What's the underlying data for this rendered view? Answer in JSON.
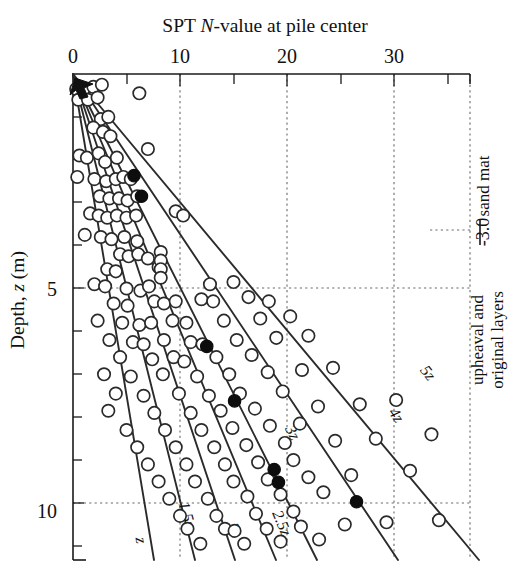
{
  "chart_data": {
    "type": "scatter",
    "title": "SPT N-value at pile center",
    "title_parts": {
      "pre": "SPT ",
      "italic": "N",
      "post": "-value at pile center"
    },
    "xlabel": "SPT N-value at pile center",
    "ylabel": "Depth, z (m)",
    "ylabel_parts": {
      "pre": "Depth, ",
      "italic": "z",
      "post": " (m)"
    },
    "xlim": [
      0,
      35
    ],
    "ylim": [
      0,
      11.35
    ],
    "y_inverted": true,
    "xticks_major": [
      0,
      10,
      20,
      30
    ],
    "xticklabels": [
      "0",
      "10",
      "20",
      "30"
    ],
    "xticks_minor": [
      5,
      15,
      25,
      35
    ],
    "yticks_major": [
      5,
      10
    ],
    "yticklabels": [
      "5",
      "10"
    ],
    "yticks_minor": [
      1,
      2,
      3,
      4,
      6,
      7,
      8,
      9,
      11
    ],
    "grid": "dotted",
    "grid_x": [
      10,
      20,
      30,
      35
    ],
    "grid_y": [
      5,
      10
    ],
    "legend_position": "none",
    "annotations": [
      {
        "name": "sand-mat",
        "text": "sand mat",
        "rotation": -90
      },
      {
        "name": "depth-marker",
        "text": "-3.0",
        "rotation": -90
      },
      {
        "name": "layers-line-1",
        "text": "upheaval and",
        "rotation": -90
      },
      {
        "name": "layers-line-2",
        "text": "original layers",
        "rotation": -90
      },
      {
        "name": "origin-arrow",
        "text": "",
        "rotation": 0
      }
    ],
    "curves": [
      {
        "label": "z",
        "slope_n_per_m": 1.3,
        "label_x": 5.9,
        "label_z": 10.7
      },
      {
        "label": "1.5z",
        "slope_n_per_m": 1.95,
        "label_x": 10.2,
        "label_z": 10.2
      },
      {
        "label": "2z",
        "slope_n_per_m": 2.6,
        "label_x": 14.0,
        "label_z": 10.5
      },
      {
        "label": "2.5z",
        "slope_n_per_m": 3.25,
        "label_x": 18.2,
        "label_z": 10.5
      },
      {
        "label": "3z",
        "slope_n_per_m": 3.9,
        "label_x": 19.5,
        "label_z": 8.3
      },
      {
        "label": "4z",
        "slope_n_per_m": 5.2,
        "label_x": 29.0,
        "label_z": 7.9
      },
      {
        "label": "5z",
        "slope_n_per_m": 6.5,
        "label_x": 31.5,
        "label_z": 7.0
      }
    ],
    "series": [
      {
        "name": "open-circles",
        "marker": "open circle",
        "points": [
          [
            0.3,
            0.35
          ],
          [
            1.0,
            0.35
          ],
          [
            1.9,
            0.3
          ],
          [
            2.7,
            0.25
          ],
          [
            0.5,
            0.6
          ],
          [
            1.4,
            0.6
          ],
          [
            2.3,
            0.55
          ],
          [
            6.2,
            0.45
          ],
          [
            2.6,
            1.05
          ],
          [
            3.3,
            1.0
          ],
          [
            1.9,
            1.25
          ],
          [
            2.8,
            1.35
          ],
          [
            3.5,
            1.45
          ],
          [
            0.6,
            1.9
          ],
          [
            1.3,
            1.95
          ],
          [
            2.4,
            1.85
          ],
          [
            3.0,
            2.05
          ],
          [
            4.1,
            1.95
          ],
          [
            7.0,
            1.75
          ],
          [
            0.4,
            2.4
          ],
          [
            2.0,
            2.45
          ],
          [
            3.1,
            2.5
          ],
          [
            4.0,
            2.45
          ],
          [
            4.7,
            2.4
          ],
          [
            5.4,
            2.45
          ],
          [
            2.5,
            2.85
          ],
          [
            3.4,
            2.9
          ],
          [
            4.3,
            2.9
          ],
          [
            5.1,
            2.95
          ],
          [
            6.0,
            2.85
          ],
          [
            1.6,
            3.25
          ],
          [
            2.4,
            3.3
          ],
          [
            3.2,
            3.35
          ],
          [
            4.1,
            3.3
          ],
          [
            5.0,
            3.35
          ],
          [
            5.9,
            3.3
          ],
          [
            9.6,
            3.2
          ],
          [
            10.3,
            3.3
          ],
          [
            1.1,
            3.75
          ],
          [
            2.6,
            3.8
          ],
          [
            3.6,
            3.85
          ],
          [
            4.8,
            3.8
          ],
          [
            6.0,
            3.9
          ],
          [
            4.4,
            4.2
          ],
          [
            5.2,
            4.25
          ],
          [
            6.1,
            4.2
          ],
          [
            7.0,
            4.3
          ],
          [
            3.2,
            4.55
          ],
          [
            4.0,
            4.6
          ],
          [
            8.0,
            4.5
          ],
          [
            8.2,
            4.15
          ],
          [
            8.2,
            4.35
          ],
          [
            8.2,
            4.55
          ],
          [
            8.2,
            4.75
          ],
          [
            2.0,
            4.9
          ],
          [
            3.0,
            4.95
          ],
          [
            5.0,
            5.0
          ],
          [
            6.3,
            5.05
          ],
          [
            7.1,
            4.95
          ],
          [
            12.8,
            4.9
          ],
          [
            15.0,
            4.85
          ],
          [
            3.8,
            5.35
          ],
          [
            5.1,
            5.4
          ],
          [
            7.6,
            5.3
          ],
          [
            8.5,
            5.35
          ],
          [
            9.6,
            5.3
          ],
          [
            12.0,
            5.25
          ],
          [
            13.1,
            5.3
          ],
          [
            16.4,
            5.2
          ],
          [
            18.3,
            5.3
          ],
          [
            2.3,
            5.75
          ],
          [
            4.6,
            5.8
          ],
          [
            6.2,
            5.85
          ],
          [
            7.3,
            5.8
          ],
          [
            9.3,
            5.75
          ],
          [
            10.6,
            5.8
          ],
          [
            14.1,
            5.75
          ],
          [
            17.5,
            5.7
          ],
          [
            20.3,
            5.65
          ],
          [
            3.4,
            6.2
          ],
          [
            5.6,
            6.25
          ],
          [
            6.6,
            6.3
          ],
          [
            8.5,
            6.2
          ],
          [
            11.0,
            6.25
          ],
          [
            12.1,
            6.3
          ],
          [
            15.3,
            6.2
          ],
          [
            19.0,
            6.15
          ],
          [
            22.0,
            6.1
          ],
          [
            4.4,
            6.6
          ],
          [
            7.4,
            6.65
          ],
          [
            9.4,
            6.6
          ],
          [
            10.4,
            6.7
          ],
          [
            13.4,
            6.6
          ],
          [
            16.7,
            6.55
          ],
          [
            2.9,
            7.0
          ],
          [
            5.4,
            7.05
          ],
          [
            8.4,
            7.0
          ],
          [
            11.6,
            7.05
          ],
          [
            14.6,
            7.0
          ],
          [
            18.2,
            6.95
          ],
          [
            21.4,
            6.9
          ],
          [
            24.3,
            6.85
          ],
          [
            4.0,
            7.45
          ],
          [
            6.6,
            7.5
          ],
          [
            9.9,
            7.45
          ],
          [
            12.7,
            7.5
          ],
          [
            15.6,
            7.45
          ],
          [
            19.6,
            7.4
          ],
          [
            3.3,
            7.85
          ],
          [
            7.6,
            7.9
          ],
          [
            11.0,
            7.9
          ],
          [
            13.8,
            7.85
          ],
          [
            17.0,
            7.8
          ],
          [
            22.9,
            7.75
          ],
          [
            26.8,
            7.7
          ],
          [
            30.2,
            7.6
          ],
          [
            5.0,
            8.3
          ],
          [
            8.6,
            8.3
          ],
          [
            12.0,
            8.3
          ],
          [
            14.9,
            8.25
          ],
          [
            18.4,
            8.2
          ],
          [
            21.2,
            8.15
          ],
          [
            6.0,
            8.7
          ],
          [
            9.6,
            8.7
          ],
          [
            13.2,
            8.7
          ],
          [
            16.2,
            8.65
          ],
          [
            19.8,
            8.6
          ],
          [
            24.5,
            8.55
          ],
          [
            28.3,
            8.5
          ],
          [
            33.5,
            8.4
          ],
          [
            7.0,
            9.1
          ],
          [
            10.6,
            9.1
          ],
          [
            14.2,
            9.1
          ],
          [
            17.3,
            9.05
          ],
          [
            20.6,
            9.0
          ],
          [
            8.0,
            9.5
          ],
          [
            11.4,
            9.5
          ],
          [
            15.0,
            9.5
          ],
          [
            18.2,
            9.45
          ],
          [
            22.0,
            9.4
          ],
          [
            26.0,
            9.35
          ],
          [
            31.5,
            9.25
          ],
          [
            9.0,
            9.9
          ],
          [
            12.6,
            9.9
          ],
          [
            16.3,
            9.85
          ],
          [
            19.4,
            9.8
          ],
          [
            23.4,
            9.75
          ],
          [
            10.0,
            10.3
          ],
          [
            13.4,
            10.3
          ],
          [
            17.1,
            10.25
          ],
          [
            20.6,
            10.2
          ],
          [
            10.7,
            10.6
          ],
          [
            14.2,
            10.6
          ],
          [
            15.1,
            10.65
          ],
          [
            18.1,
            10.6
          ],
          [
            21.3,
            10.55
          ],
          [
            25.4,
            10.5
          ],
          [
            29.3,
            10.45
          ],
          [
            34.2,
            10.4
          ],
          [
            11.9,
            10.95
          ],
          [
            16.0,
            10.95
          ],
          [
            19.4,
            10.9
          ],
          [
            23.0,
            10.85
          ]
        ]
      },
      {
        "name": "filled-circles",
        "marker": "filled circle",
        "points": [
          [
            5.7,
            2.37
          ],
          [
            6.4,
            2.85
          ],
          [
            12.5,
            6.35
          ],
          [
            15.1,
            7.62
          ],
          [
            18.8,
            9.22
          ],
          [
            19.2,
            9.52
          ],
          [
            26.5,
            9.97
          ]
        ]
      }
    ]
  },
  "geometry": {
    "note": "pixel mapping: x0=73,y0=74, px_per_unit_x=10.7, px_per_m=42.9"
  }
}
